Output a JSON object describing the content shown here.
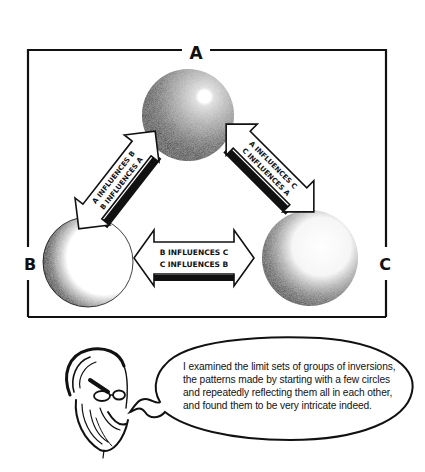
{
  "diagram": {
    "nodes": [
      {
        "id": "A",
        "label": "A"
      },
      {
        "id": "B",
        "label": "B"
      },
      {
        "id": "C",
        "label": "C"
      }
    ],
    "edges": [
      {
        "between": [
          "A",
          "B"
        ],
        "labels": [
          "A INFLUENCES B",
          "B INFLUENCES A"
        ]
      },
      {
        "between": [
          "A",
          "C"
        ],
        "labels": [
          "A INFLUENCES C",
          "C INFLUENCES A"
        ]
      },
      {
        "between": [
          "B",
          "C"
        ],
        "labels": [
          "B INFLUENCES C",
          "C INFLUENCES B"
        ]
      }
    ]
  },
  "caption": {
    "speaker_icon": "bearded-man-with-glasses-portrait",
    "lines": [
      "I examined the limit sets of groups of inversions,",
      "the patterns made by starting with a few circles",
      "and repeatedly reflecting them all in each other,",
      "and found them to be very intricate indeed."
    ]
  },
  "colors": {
    "ink": "#111111",
    "paper": "#ffffff"
  }
}
